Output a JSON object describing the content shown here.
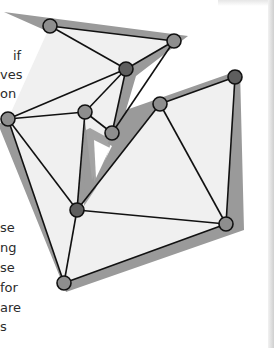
{
  "text_fragments_top": [
    {
      "text": "if",
      "x": 13,
      "y": 48
    },
    {
      "text": "ves",
      "x": 0,
      "y": 67
    },
    {
      "text": "on",
      "x": 0,
      "y": 86
    }
  ],
  "text_fragments_bottom": [
    {
      "text": "se",
      "x": 0,
      "y": 220
    },
    {
      "text": "ng",
      "x": 0,
      "y": 240
    },
    {
      "text": "se",
      "x": 0,
      "y": 260
    },
    {
      "text": "for",
      "x": 0,
      "y": 280
    },
    {
      "text": "are",
      "x": 0,
      "y": 300
    },
    {
      "text": "s",
      "x": 0,
      "y": 319
    }
  ],
  "figure": {
    "colors": {
      "band": "#9a9a9a",
      "fill": "#f0f0f0",
      "edge": "#111111",
      "vertex_light": "#8e8e8e",
      "vertex_dark": "#5e5e5e"
    },
    "vertices": [
      {
        "id": "v1",
        "x": 50,
        "y": 26,
        "tone": "light"
      },
      {
        "id": "v2",
        "x": 174,
        "y": 41,
        "tone": "light"
      },
      {
        "id": "v3",
        "x": 126,
        "y": 69,
        "tone": "dark"
      },
      {
        "id": "v4",
        "x": 8,
        "y": 119,
        "tone": "light"
      },
      {
        "id": "v5",
        "x": 85,
        "y": 112,
        "tone": "light"
      },
      {
        "id": "v6",
        "x": 112,
        "y": 133,
        "tone": "light"
      },
      {
        "id": "v7",
        "x": 160,
        "y": 104,
        "tone": "light"
      },
      {
        "id": "v8",
        "x": 235,
        "y": 77,
        "tone": "dark"
      },
      {
        "id": "v9",
        "x": 77,
        "y": 210,
        "tone": "dark"
      },
      {
        "id": "v10",
        "x": 226,
        "y": 224,
        "tone": "light"
      },
      {
        "id": "v11",
        "x": 64,
        "y": 283,
        "tone": "light"
      }
    ]
  }
}
